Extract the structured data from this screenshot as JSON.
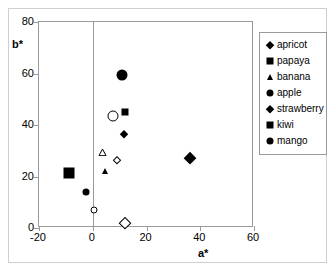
{
  "chart_data": {
    "type": "scatter",
    "title": "",
    "xlabel": "a*",
    "ylabel": "b*",
    "xlim": [
      -20,
      60
    ],
    "ylim": [
      0,
      80
    ],
    "xticks": [
      "-20",
      "0",
      "20",
      "40",
      "60"
    ],
    "yticks": [
      "0",
      "20",
      "40",
      "60",
      "80"
    ],
    "xtick_values": [
      -20,
      0,
      20,
      40,
      60
    ],
    "ytick_values": [
      0,
      20,
      40,
      60,
      80
    ],
    "grid": false,
    "zero_line": true,
    "legend_position": "right",
    "legend_entries": [
      "apricot",
      "papaya",
      "banana",
      "apple",
      "strawberry",
      "kiwi",
      "mango"
    ],
    "series": [
      {
        "name": "apricot",
        "marker": "diamond",
        "fill": "filled",
        "size": "small",
        "points": [
          {
            "a": 11.5,
            "b": 36.5
          }
        ]
      },
      {
        "name": "papaya",
        "marker": "square",
        "fill": "filled",
        "size": "small",
        "points": [
          {
            "a": 12,
            "b": 45
          }
        ]
      },
      {
        "name": "banana",
        "marker": "triangle",
        "fill": "filled",
        "size": "small",
        "points": [
          {
            "a": 4.5,
            "b": 22
          }
        ]
      },
      {
        "name": "apple",
        "marker": "circle",
        "fill": "filled",
        "size": "small",
        "points": [
          {
            "a": -2.5,
            "b": 14
          }
        ]
      },
      {
        "name": "strawberry",
        "marker": "diamond",
        "fill": "filled",
        "size": "large",
        "points": [
          {
            "a": 36,
            "b": 27
          }
        ]
      },
      {
        "name": "kiwi",
        "marker": "square",
        "fill": "filled",
        "size": "large",
        "points": [
          {
            "a": -9,
            "b": 21.5
          }
        ]
      },
      {
        "name": "mango",
        "marker": "circle",
        "fill": "filled",
        "size": "large",
        "points": [
          {
            "a": 11,
            "b": 59.5
          }
        ]
      },
      {
        "name": "apple-open",
        "marker": "circle",
        "fill": "open",
        "size": "large",
        "points": [
          {
            "a": 7.5,
            "b": 43.5
          }
        ]
      },
      {
        "name": "apple-open-small",
        "marker": "circle",
        "fill": "open",
        "size": "small",
        "points": [
          {
            "a": 0.5,
            "b": 7
          }
        ]
      },
      {
        "name": "banana-open",
        "marker": "triangle",
        "fill": "open",
        "size": "small",
        "points": [
          {
            "a": 3.5,
            "b": 27
          }
        ]
      },
      {
        "name": "apricot-open",
        "marker": "diamond",
        "fill": "open",
        "size": "small",
        "points": [
          {
            "a": 9,
            "b": 26.5
          }
        ]
      },
      {
        "name": "strawberry-open",
        "marker": "diamond",
        "fill": "open",
        "size": "large",
        "points": [
          {
            "a": 12,
            "b": 2
          }
        ]
      }
    ],
    "colors": {
      "marker": "#000000",
      "axis": "#9a9a9a",
      "frame": "#9a9a9a",
      "background": "#ffffff"
    }
  }
}
